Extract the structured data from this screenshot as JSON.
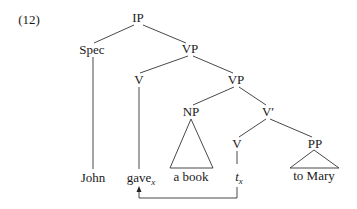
{
  "example_number": "(12)",
  "nodes": {
    "ip": "IP",
    "spec": "Spec",
    "vp1": "VP",
    "v1": "V",
    "vp2": "VP",
    "np": "NP",
    "vbar": "V′",
    "v2": "V",
    "pp": "PP"
  },
  "leaves": {
    "john": "John",
    "gave": "gave",
    "gave_sub": "x",
    "a_book": "a book",
    "trace": "t",
    "trace_sub": "x",
    "to_mary": "to Mary"
  },
  "colors": {
    "line": "#333333",
    "text": "#1a1a1a"
  }
}
